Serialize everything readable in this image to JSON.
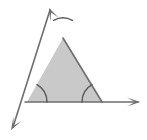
{
  "figure": {
    "kind": "geometry-diagram",
    "canvas": {
      "width": 147,
      "height": 140,
      "background": "#ffffff"
    },
    "colors": {
      "background": "#ffffff",
      "triangle_fill": "#c9c9c9",
      "stroke": "#6e6e6e",
      "arc_stroke": "#5a5a5a",
      "arrow_fill": "#6e6e6e"
    },
    "stroke_widths": {
      "side": 1.6,
      "ray": 1.6,
      "arc": 1.5
    },
    "triangle": {
      "name": "shaded-triangle",
      "vertices": [
        {
          "label": "apex",
          "x": 63,
          "y": 38
        },
        {
          "label": "bottom-left",
          "x": 27,
          "y": 102
        },
        {
          "label": "bottom-right",
          "x": 102,
          "y": 102
        }
      ]
    },
    "angle_arcs": [
      {
        "name": "apex-angle-arc",
        "at": "apex",
        "cx": 63,
        "cy": 38,
        "radius": 20,
        "start_deg": 62,
        "end_deg": 118
      },
      {
        "name": "bottom-left-angle-arc",
        "at": "bottom-left",
        "cx": 27,
        "cy": 102,
        "radius": 20,
        "start_deg": 0,
        "end_deg": 60
      },
      {
        "name": "bottom-right-angle-arc",
        "at": "bottom-right",
        "cx": 102,
        "cy": 102,
        "radius": 20,
        "start_deg": 120,
        "end_deg": 180
      }
    ],
    "rays": [
      {
        "name": "upper-left-ray",
        "from": {
          "x": 63,
          "y": 38
        },
        "to": {
          "x": 49,
          "y": 8
        },
        "arrowhead": "at-end",
        "direction": "up-left"
      },
      {
        "name": "lower-left-ray",
        "from": {
          "x": 27,
          "y": 102
        },
        "to": {
          "x": 11,
          "y": 130
        },
        "arrowhead": "at-end",
        "direction": "down-left"
      },
      {
        "name": "right-ray",
        "from": {
          "x": 102,
          "y": 102
        },
        "to": {
          "x": 140,
          "y": 102
        },
        "arrowhead": "at-end",
        "direction": "right"
      }
    ],
    "labels": []
  }
}
